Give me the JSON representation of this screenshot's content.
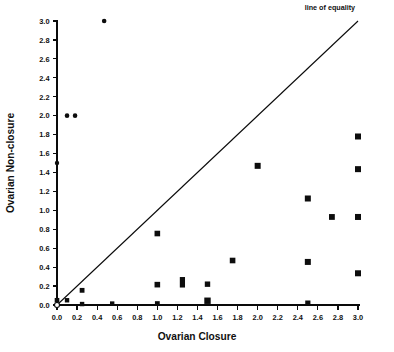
{
  "chart_data": {
    "type": "scatter",
    "title": "",
    "xlabel": "Ovarian Closure",
    "ylabel": "Ovarian Non-closure",
    "xlim": [
      0.0,
      3.0
    ],
    "ylim": [
      0.0,
      3.0
    ],
    "grid": false,
    "xticks": [
      "0.0",
      "0.2",
      "0.4",
      "0.6",
      "0.8",
      "1.0",
      "1.2",
      "1.4",
      "1.6",
      "1.8",
      "2.0",
      "2.2",
      "2.4",
      "2.6",
      "2.8",
      "3.0"
    ],
    "yticks": [
      "0.0",
      "0.2",
      "0.4",
      "0.6",
      "0.8",
      "1.0",
      "1.2",
      "1.4",
      "1.6",
      "1.8",
      "2.0",
      "2.2",
      "2.4",
      "2.6",
      "2.8",
      "3.0"
    ],
    "xtick_values": [
      0.0,
      0.2,
      0.4,
      0.6,
      0.8,
      1.0,
      1.2,
      1.4,
      1.6,
      1.8,
      2.0,
      2.2,
      2.4,
      2.6,
      2.8,
      3.0
    ],
    "ytick_values": [
      0.0,
      0.2,
      0.4,
      0.6,
      0.8,
      1.0,
      1.2,
      1.4,
      1.6,
      1.8,
      2.0,
      2.2,
      2.4,
      2.6,
      2.8,
      3.0
    ],
    "annotations": [
      {
        "text": "line of equality",
        "x": 2.72,
        "y": 3.12
      }
    ],
    "reference_line": {
      "name": "line of equality",
      "from": [
        0.0,
        0.0
      ],
      "to": [
        3.0,
        3.0
      ],
      "slope": 1.0,
      "intercept": 0.0
    },
    "series": [
      {
        "name": "observations",
        "marker": "square",
        "color": "#0d0d0d",
        "points": [
          {
            "x": 0.0,
            "y": 0.0,
            "marker": "open-circle",
            "w": 5.0,
            "h": 5.0
          },
          {
            "x": 0.0,
            "y": 0.05,
            "marker": "square",
            "w": 4.6,
            "h": 4.6
          },
          {
            "x": 0.0,
            "y": 1.5,
            "marker": "circle",
            "w": 4.4,
            "h": 4.4
          },
          {
            "x": 0.1,
            "y": 2.0,
            "marker": "circle",
            "w": 4.6,
            "h": 4.6
          },
          {
            "x": 0.18,
            "y": 2.0,
            "marker": "circle",
            "w": 4.6,
            "h": 4.6
          },
          {
            "x": 0.47,
            "y": 3.0,
            "marker": "circle",
            "w": 4.6,
            "h": 4.6
          },
          {
            "x": 0.1,
            "y": 0.05,
            "marker": "square",
            "w": 4.4,
            "h": 4.4
          },
          {
            "x": 0.25,
            "y": 0.155,
            "marker": "square",
            "w": 4.8,
            "h": 4.8
          },
          {
            "x": 0.25,
            "y": 0.01,
            "marker": "square",
            "w": 4.4,
            "h": 4.4
          },
          {
            "x": 0.55,
            "y": 0.015,
            "marker": "square",
            "w": 4.4,
            "h": 4.4
          },
          {
            "x": 1.0,
            "y": 0.755,
            "marker": "square",
            "w": 5.6,
            "h": 5.6
          },
          {
            "x": 1.0,
            "y": 0.215,
            "marker": "square",
            "w": 5.6,
            "h": 5.6
          },
          {
            "x": 1.0,
            "y": 0.015,
            "marker": "square",
            "w": 4.8,
            "h": 4.8
          },
          {
            "x": 1.25,
            "y": 0.24,
            "marker": "square",
            "w": 5.2,
            "h": 10.5
          },
          {
            "x": 1.5,
            "y": 0.22,
            "marker": "square",
            "w": 5.4,
            "h": 5.4
          },
          {
            "x": 1.5,
            "y": 0.045,
            "marker": "square",
            "w": 6.4,
            "h": 6.4
          },
          {
            "x": 1.75,
            "y": 0.47,
            "marker": "square",
            "w": 5.6,
            "h": 5.6
          },
          {
            "x": 2.0,
            "y": 1.47,
            "marker": "square",
            "w": 6.0,
            "h": 6.0
          },
          {
            "x": 2.5,
            "y": 1.125,
            "marker": "square",
            "w": 6.0,
            "h": 6.0
          },
          {
            "x": 2.5,
            "y": 0.455,
            "marker": "square",
            "w": 6.0,
            "h": 6.0
          },
          {
            "x": 2.5,
            "y": 0.02,
            "marker": "square",
            "w": 5.2,
            "h": 5.2
          },
          {
            "x": 2.74,
            "y": 0.93,
            "marker": "square",
            "w": 5.8,
            "h": 5.8
          },
          {
            "x": 3.0,
            "y": 1.78,
            "marker": "square",
            "w": 6.0,
            "h": 6.0
          },
          {
            "x": 3.0,
            "y": 1.435,
            "marker": "square",
            "w": 6.0,
            "h": 6.0
          },
          {
            "x": 3.0,
            "y": 0.93,
            "marker": "square",
            "w": 6.0,
            "h": 6.0
          },
          {
            "x": 3.0,
            "y": 0.335,
            "marker": "square",
            "w": 6.0,
            "h": 6.0
          }
        ]
      }
    ]
  },
  "figure": {
    "background_color": "#ffffff",
    "axis_color": "#0a0a0a",
    "marker_color": "#0d0d0d"
  }
}
